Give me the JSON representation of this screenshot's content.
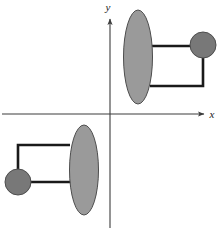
{
  "figure": {
    "width": 224,
    "height": 230,
    "background_color": "#ffffff"
  },
  "colors": {
    "ellipse_fill": "#9a9a9a",
    "ellipse_stroke": "#4d4d4d",
    "circle_fill": "#787878",
    "circle_stroke": "#4d4d4d",
    "connector_stroke": "#1a1a1a",
    "axis_stroke": "#3c3c3c",
    "label_color": "#1a1a1a"
  },
  "axes": {
    "origin": {
      "x": 110,
      "y": 114
    },
    "x_axis": {
      "label": "x",
      "label_x": 212,
      "label_y": 118,
      "start_x": 2,
      "end_x": 204,
      "y": 114,
      "arrow": "right"
    },
    "y_axis": {
      "label": "y",
      "label_x": 108,
      "label_y": 11,
      "top_y": 19,
      "bottom_y": 228,
      "x": 110,
      "arrow": "up"
    },
    "stroke_width": 1.1
  },
  "shapes": {
    "upper_figure": {
      "name": "upper-right-figure",
      "quadrant": "I",
      "ellipse": {
        "cx": 138,
        "cy": 57,
        "rx": 14.5,
        "ry": 47
      },
      "circle": {
        "cx": 203,
        "cy": 45,
        "r": 13
      },
      "connector": {
        "points": "152,46 203,46 203,86 150,86",
        "top_y": 46,
        "bottom_y": 86,
        "vertical_x": 203,
        "left_x": 150,
        "stroke_width": 2.6
      }
    },
    "lower_figure": {
      "name": "lower-left-figure",
      "quadrant": "III",
      "ellipse": {
        "cx": 84,
        "cy": 170,
        "rx": 14.5,
        "ry": 45
      },
      "circle": {
        "cx": 18,
        "cy": 182,
        "r": 13
      },
      "connector": {
        "points": "70,145 18,145 18,182 72,182",
        "top_y": 145,
        "bottom_y": 182,
        "vertical_x": 18,
        "right_x": 72,
        "stroke_width": 2.6
      }
    }
  }
}
